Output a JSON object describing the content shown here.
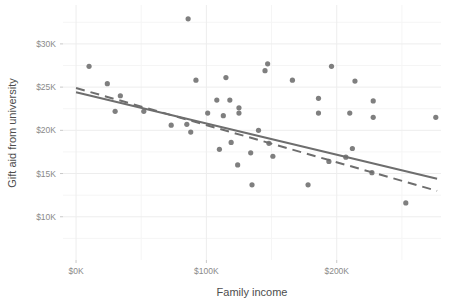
{
  "chart_data": {
    "type": "scatter",
    "title": "",
    "xlabel": "Family income",
    "ylabel": "Gift aid from university",
    "xlim": [
      -10000,
      280000
    ],
    "ylim": [
      5000,
      34500
    ],
    "grid": true,
    "legend": "none",
    "x_ticks": [
      {
        "value": 0,
        "label": "$0K"
      },
      {
        "value": 100000,
        "label": "$100K"
      },
      {
        "value": 200000,
        "label": "$200K"
      }
    ],
    "y_ticks": [
      {
        "value": 10000,
        "label": "$10K"
      },
      {
        "value": 15000,
        "label": "$15K"
      },
      {
        "value": 20000,
        "label": "$20K"
      },
      {
        "value": 25000,
        "label": "$25K"
      },
      {
        "value": 30000,
        "label": "$30K"
      }
    ],
    "x_minor_ticks": [
      50000,
      150000,
      250000
    ],
    "y_minor_ticks": [
      7500,
      12500,
      17500,
      22500,
      27500,
      32500
    ],
    "point_color": "#7f7f7f",
    "line_color": "#6e6e6e",
    "grid_color": "#ededed",
    "points": [
      {
        "x": 86000,
        "y": 32900
      },
      {
        "x": 10000,
        "y": 27400
      },
      {
        "x": 147000,
        "y": 27700
      },
      {
        "x": 145000,
        "y": 26900
      },
      {
        "x": 196000,
        "y": 27400
      },
      {
        "x": 24000,
        "y": 25400
      },
      {
        "x": 92000,
        "y": 25800
      },
      {
        "x": 115000,
        "y": 26100
      },
      {
        "x": 166000,
        "y": 25800
      },
      {
        "x": 214000,
        "y": 25700
      },
      {
        "x": 34000,
        "y": 24000
      },
      {
        "x": 186000,
        "y": 23700
      },
      {
        "x": 108000,
        "y": 23500
      },
      {
        "x": 118000,
        "y": 23500
      },
      {
        "x": 228000,
        "y": 23400
      },
      {
        "x": 30000,
        "y": 22200
      },
      {
        "x": 52000,
        "y": 22200
      },
      {
        "x": 125000,
        "y": 22600
      },
      {
        "x": 125000,
        "y": 22000
      },
      {
        "x": 186000,
        "y": 22000
      },
      {
        "x": 210000,
        "y": 22000
      },
      {
        "x": 101000,
        "y": 22000
      },
      {
        "x": 113000,
        "y": 21700
      },
      {
        "x": 228000,
        "y": 21500
      },
      {
        "x": 276000,
        "y": 21500
      },
      {
        "x": 73000,
        "y": 20600
      },
      {
        "x": 85000,
        "y": 20700
      },
      {
        "x": 88000,
        "y": 19800
      },
      {
        "x": 140000,
        "y": 20000
      },
      {
        "x": 119000,
        "y": 18600
      },
      {
        "x": 148000,
        "y": 18500
      },
      {
        "x": 110000,
        "y": 17800
      },
      {
        "x": 134000,
        "y": 17400
      },
      {
        "x": 212000,
        "y": 17900
      },
      {
        "x": 151000,
        "y": 17000
      },
      {
        "x": 194000,
        "y": 16400
      },
      {
        "x": 207000,
        "y": 16900
      },
      {
        "x": 124000,
        "y": 16000
      },
      {
        "x": 227000,
        "y": 15100
      },
      {
        "x": 135000,
        "y": 13700
      },
      {
        "x": 178000,
        "y": 13700
      },
      {
        "x": 253000,
        "y": 11600
      }
    ],
    "trend_solid": {
      "x1": 0,
      "y1": 24400,
      "x2": 277000,
      "y2": 14400
    },
    "trend_dashed": {
      "x1": 0,
      "y1": 24900,
      "x2": 277000,
      "y2": 13000
    }
  }
}
